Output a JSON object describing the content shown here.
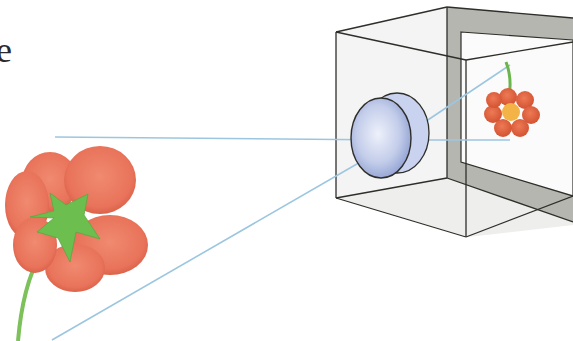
{
  "figure": {
    "partial_text": "e",
    "colors": {
      "background": "#ffffff",
      "ray": "#9cc6e0",
      "box_line": "#2e2e2a",
      "box_face": "#f1f2f1",
      "box_back_frame": "#b3b3ae",
      "screen": "#fafafa",
      "petal": "#e8735a",
      "petal_dark": "#d9573f",
      "sepal": "#6cbf4f",
      "stem": "#7cc159",
      "flower_center": "#f4b347",
      "lens": "#b8c6e8"
    },
    "elements": {
      "object_flower": "Large red flower (object), viewed from behind with green sepals and stem",
      "lens": "Convex lens mounted in front face of box",
      "box": "Transparent box (camera) with back screen",
      "image_flower": "Small inverted flower image projected on back screen",
      "rays": "Two light rays from flower through lens to screen"
    }
  }
}
